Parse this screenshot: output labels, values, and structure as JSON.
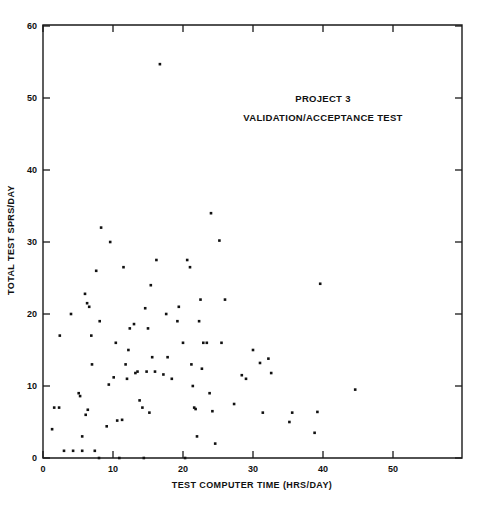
{
  "chart_data": {
    "type": "scatter",
    "title": "",
    "xlabel": "TEST COMPUTER TIME (HRS/DAY)",
    "ylabel": "TOTAL TEST SPRS/DAY",
    "xlim": [
      0,
      60
    ],
    "ylim": [
      0,
      60
    ],
    "xticks": [
      0,
      10,
      20,
      30,
      40,
      50
    ],
    "yticks": [
      0,
      10,
      20,
      30,
      40,
      50,
      60
    ],
    "xtick_labels": [
      "0",
      "10",
      "20",
      "30",
      "40",
      "50"
    ],
    "ytick_labels": [
      "0",
      "10",
      "20",
      "30",
      "40",
      "50",
      "60"
    ],
    "grid": false,
    "legend": null,
    "marker": "filled-square",
    "marker_color": "#111111",
    "annotations": [
      {
        "text": "PROJECT 3",
        "x": 40.0,
        "y": 49.5
      },
      {
        "text": "VALIDATION/ACCEPTANCE TEST",
        "x": 40.0,
        "y": 46.8
      }
    ],
    "points": [
      [
        1.3,
        4.0
      ],
      [
        1.6,
        7.0
      ],
      [
        2.3,
        7.0
      ],
      [
        2.4,
        17.0
      ],
      [
        3.0,
        1.0
      ],
      [
        4.0,
        20.0
      ],
      [
        4.3,
        1.0
      ],
      [
        5.1,
        9.0
      ],
      [
        5.3,
        8.6
      ],
      [
        5.6,
        1.0
      ],
      [
        5.6,
        3.0
      ],
      [
        6.0,
        22.8
      ],
      [
        6.1,
        6.0
      ],
      [
        6.3,
        21.5
      ],
      [
        6.4,
        6.7
      ],
      [
        6.6,
        21.0
      ],
      [
        6.9,
        17.0
      ],
      [
        7.0,
        13.0
      ],
      [
        7.4,
        1.0
      ],
      [
        7.6,
        26.0
      ],
      [
        8.0,
        0.0
      ],
      [
        8.1,
        19.0
      ],
      [
        8.3,
        32.0
      ],
      [
        9.1,
        4.4
      ],
      [
        9.4,
        10.2
      ],
      [
        9.6,
        30.0
      ],
      [
        10.1,
        11.2
      ],
      [
        10.4,
        16.0
      ],
      [
        10.6,
        5.2
      ],
      [
        10.9,
        0.0
      ],
      [
        11.3,
        5.3
      ],
      [
        11.5,
        26.5
      ],
      [
        11.8,
        13.0
      ],
      [
        12.0,
        11.0
      ],
      [
        12.2,
        15.0
      ],
      [
        12.4,
        18.0
      ],
      [
        13.0,
        18.6
      ],
      [
        13.2,
        11.8
      ],
      [
        13.5,
        12.0
      ],
      [
        13.8,
        8.0
      ],
      [
        14.2,
        7.0
      ],
      [
        14.4,
        0.0
      ],
      [
        14.6,
        20.8
      ],
      [
        14.8,
        12.0
      ],
      [
        15.0,
        18.0
      ],
      [
        15.2,
        6.3
      ],
      [
        15.4,
        24.0
      ],
      [
        15.6,
        14.0
      ],
      [
        16.0,
        12.0
      ],
      [
        16.2,
        27.5
      ],
      [
        16.7,
        54.7
      ],
      [
        17.2,
        11.6
      ],
      [
        17.6,
        20.0
      ],
      [
        17.8,
        14.0
      ],
      [
        18.4,
        11.0
      ],
      [
        19.2,
        19.0
      ],
      [
        19.4,
        21.0
      ],
      [
        20.0,
        16.0
      ],
      [
        20.3,
        0.0
      ],
      [
        20.6,
        27.5
      ],
      [
        21.0,
        26.5
      ],
      [
        21.2,
        13.0
      ],
      [
        21.4,
        10.0
      ],
      [
        21.6,
        7.0
      ],
      [
        21.8,
        6.8
      ],
      [
        22.0,
        3.0
      ],
      [
        22.3,
        19.0
      ],
      [
        22.5,
        22.0
      ],
      [
        22.7,
        12.4
      ],
      [
        22.9,
        16.0
      ],
      [
        23.4,
        16.0
      ],
      [
        23.8,
        9.0
      ],
      [
        24.0,
        34.0
      ],
      [
        24.2,
        6.5
      ],
      [
        24.6,
        2.0
      ],
      [
        25.2,
        30.2
      ],
      [
        25.5,
        16.0
      ],
      [
        26.0,
        22.0
      ],
      [
        27.3,
        7.5
      ],
      [
        28.4,
        11.5
      ],
      [
        29.0,
        11.0
      ],
      [
        30.0,
        15.0
      ],
      [
        31.0,
        13.2
      ],
      [
        31.4,
        6.3
      ],
      [
        32.2,
        13.8
      ],
      [
        32.6,
        11.8
      ],
      [
        35.2,
        5.0
      ],
      [
        35.6,
        6.3
      ],
      [
        38.8,
        3.5
      ],
      [
        39.2,
        6.4
      ],
      [
        39.6,
        24.2
      ],
      [
        44.6,
        9.5
      ]
    ]
  }
}
